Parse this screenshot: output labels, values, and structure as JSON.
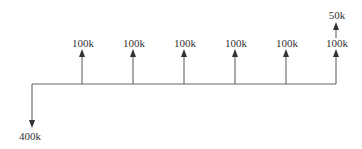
{
  "diagram": {
    "type": "cash-flow-diagram",
    "line_color": "#555555",
    "text_color": "#333333",
    "outflows": [
      {
        "label": "400k",
        "period": 0
      }
    ],
    "inflows": [
      {
        "label": "100k",
        "period": 1
      },
      {
        "label": "100k",
        "period": 2
      },
      {
        "label": "100k",
        "period": 3
      },
      {
        "label": "100k",
        "period": 4
      },
      {
        "label": "100k",
        "period": 5
      },
      {
        "label": "100k",
        "period": 6
      }
    ],
    "extra_inflow": {
      "label": "50k",
      "period": 6
    }
  }
}
